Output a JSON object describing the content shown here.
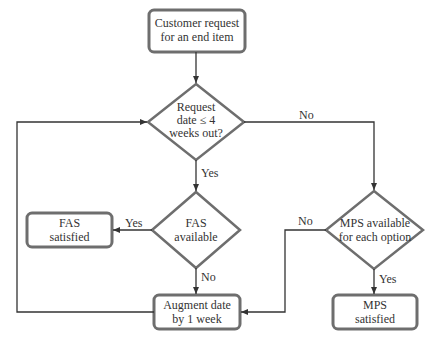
{
  "diagram": {
    "type": "flowchart",
    "nodes": {
      "start": {
        "shape": "rounded-rect",
        "line1": "Customer request",
        "line2": "for an end item"
      },
      "decision_date": {
        "shape": "diamond",
        "line1": "Request",
        "line2": "date ≤ 4",
        "line3": "weeks out?"
      },
      "decision_fas": {
        "shape": "diamond",
        "line1": "FAS",
        "line2": "available"
      },
      "fas_satisfied": {
        "shape": "rounded-rect",
        "line1": "FAS",
        "line2": "satisfied"
      },
      "decision_mps": {
        "shape": "diamond",
        "line1": "MPS available",
        "line2": "for each option"
      },
      "augment": {
        "shape": "rounded-rect",
        "line1": "Augment date",
        "line2": "by 1 week"
      },
      "mps_satisfied": {
        "shape": "rounded-rect",
        "line1": "MPS",
        "line2": "satisfied"
      }
    },
    "edges": {
      "date_yes": "Yes",
      "date_no": "No",
      "fas_yes": "Yes",
      "fas_no": "No",
      "mps_no": "No",
      "mps_yes": "Yes"
    },
    "colors": {
      "stroke": "#555555",
      "box_border": "#6e6e6e",
      "text": "#333333"
    }
  }
}
